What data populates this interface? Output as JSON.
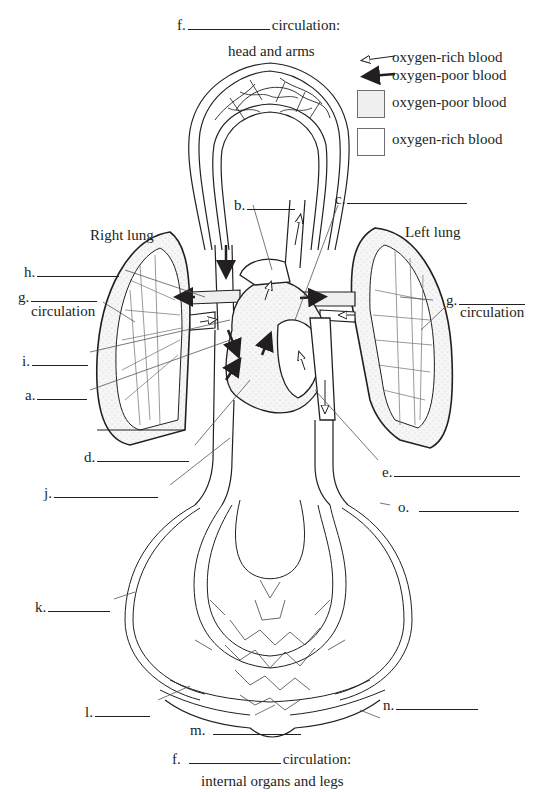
{
  "top_caption": {
    "letter": "f.",
    "suffix": "circulation:",
    "subtitle": "head and arms"
  },
  "bottom_caption": {
    "letter": "f.",
    "suffix": "circulation:",
    "subtitle": "internal organs and legs"
  },
  "legend": {
    "items": [
      {
        "icon": "hollow-arrow-left-icon",
        "label": "oxygen-rich blood"
      },
      {
        "icon": "solid-arrow-left-icon",
        "label": "oxygen-poor blood"
      },
      {
        "icon": "stippled-gray-box",
        "label": "oxygen-poor blood",
        "color": "#efefef"
      },
      {
        "icon": "white-box",
        "label": "oxygen-rich blood",
        "color": "#ffffff"
      }
    ]
  },
  "organs": {
    "right_lung": "Right lung",
    "left_lung": "Left lung"
  },
  "labels": {
    "a": {
      "letter": "a."
    },
    "b": {
      "letter": "b."
    },
    "c": {
      "letter": "c."
    },
    "d": {
      "letter": "d."
    },
    "e": {
      "letter": "e."
    },
    "g_left": {
      "letter": "g.",
      "suffix": "circulation"
    },
    "g_right": {
      "letter": "g.",
      "suffix": "circulation"
    },
    "h": {
      "letter": "h."
    },
    "i": {
      "letter": "i."
    },
    "j": {
      "letter": "j."
    },
    "k": {
      "letter": "k."
    },
    "l": {
      "letter": "l."
    },
    "m": {
      "letter": "m."
    },
    "n": {
      "letter": "n."
    },
    "o": {
      "letter": "o."
    }
  },
  "colors": {
    "ink": "#231f20",
    "stipple": "#efefef",
    "leader": "#555555"
  }
}
